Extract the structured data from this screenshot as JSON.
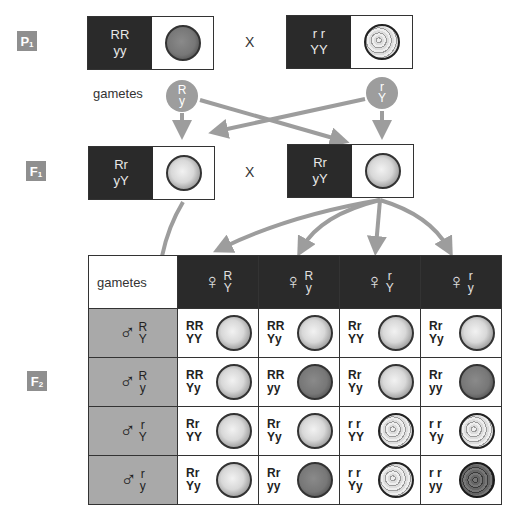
{
  "generations": {
    "p1": {
      "label": "P",
      "sub": "1"
    },
    "f1": {
      "label": "F",
      "sub": "1"
    },
    "f2": {
      "label": "F",
      "sub": "2"
    }
  },
  "cross_symbol": "X",
  "gametes_label": "gametes",
  "colors": {
    "dark_box": "#2a2a2a",
    "label_gray": "#8f8f8f",
    "male_cell": "#a9a9a9",
    "arrow_gray": "#9d9d9d"
  },
  "parents": [
    {
      "genotype_line1": "RR",
      "genotype_line2": "yy",
      "phenotype": "round-green"
    },
    {
      "genotype_line1": "r r",
      "genotype_line2": "YY",
      "phenotype": "wrinkled-yellow"
    }
  ],
  "parent_gametes": [
    {
      "line1": "R",
      "line2": "y"
    },
    {
      "line1": "r",
      "line2": "Y"
    }
  ],
  "f1": [
    {
      "genotype_line1": "Rr",
      "genotype_line2": "yY",
      "phenotype": "round-yellow"
    },
    {
      "genotype_line1": "Rr",
      "genotype_line2": "yY",
      "phenotype": "round-yellow"
    }
  ],
  "punnett": {
    "corner_label": "gametes",
    "female_symbol": "♀",
    "male_symbol": "♂",
    "female_gametes": [
      {
        "line1": "R",
        "line2": "Y"
      },
      {
        "line1": "R",
        "line2": "y"
      },
      {
        "line1": "r",
        "line2": "Y"
      },
      {
        "line1": "r",
        "line2": "y"
      }
    ],
    "male_gametes": [
      {
        "line1": "R",
        "line2": "Y"
      },
      {
        "line1": "R",
        "line2": "y"
      },
      {
        "line1": "r",
        "line2": "Y"
      },
      {
        "line1": "r",
        "line2": "y"
      }
    ],
    "rows": [
      [
        {
          "g1": "RR",
          "g2": "YY",
          "pheno": "yellow"
        },
        {
          "g1": "RR",
          "g2": "Yy",
          "pheno": "yellow"
        },
        {
          "g1": "Rr",
          "g2": "YY",
          "pheno": "yellow"
        },
        {
          "g1": "Rr",
          "g2": "Yy",
          "pheno": "yellow"
        }
      ],
      [
        {
          "g1": "RR",
          "g2": "Yy",
          "pheno": "yellow"
        },
        {
          "g1": "RR",
          "g2": "yy",
          "pheno": "green"
        },
        {
          "g1": "Rr",
          "g2": "Yy",
          "pheno": "yellow"
        },
        {
          "g1": "Rr",
          "g2": "yy",
          "pheno": "green"
        }
      ],
      [
        {
          "g1": "Rr",
          "g2": "YY",
          "pheno": "yellow"
        },
        {
          "g1": "Rr",
          "g2": "Yy",
          "pheno": "yellow"
        },
        {
          "g1": "r r",
          "g2": "YY",
          "pheno": "wrinkled-yellow"
        },
        {
          "g1": "r r",
          "g2": "Yy",
          "pheno": "wrinkled-yellow"
        }
      ],
      [
        {
          "g1": "Rr",
          "g2": "Yy",
          "pheno": "yellow"
        },
        {
          "g1": "Rr",
          "g2": "yy",
          "pheno": "green"
        },
        {
          "g1": "r r",
          "g2": "Yy",
          "pheno": "wrinkled-yellow"
        },
        {
          "g1": "r r",
          "g2": "yy",
          "pheno": "wrinkled-green"
        }
      ]
    ]
  }
}
